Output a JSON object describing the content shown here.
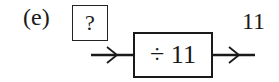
{
  "label": "(e)",
  "input": {
    "value": "?"
  },
  "operation": {
    "text": "÷ 11",
    "operator": "÷",
    "operand": "11"
  },
  "output": {
    "value": "11"
  },
  "arrows": {
    "input_arrow": "arrow-right",
    "output_arrow": "arrow-right"
  }
}
